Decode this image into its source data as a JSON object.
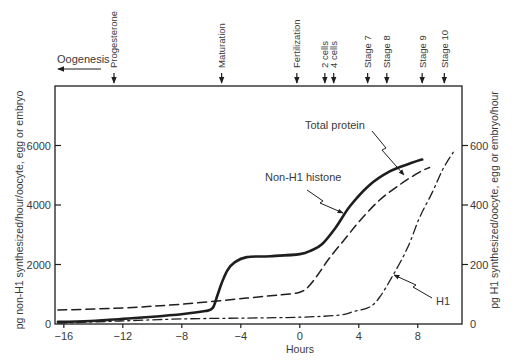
{
  "chart_data": {
    "type": "line",
    "title": "",
    "xlabel": "Hours",
    "ylabel": "pg non-H1 synthesized/hour/oocyte, egg or embryo",
    "ylabel_right": "pg H1 synthesized/oocyte, egg or embryo/hour",
    "xlim": [
      -16.6,
      11.0
    ],
    "ylim": [
      0,
      8000
    ],
    "ylim_right": [
      0,
      800
    ],
    "xticks": [
      -16,
      -12,
      -8,
      -4,
      0,
      4,
      8
    ],
    "xtick_labels": [
      "−16",
      "−12",
      "−8",
      "−4",
      "0",
      "4",
      "8"
    ],
    "yticks": [
      0,
      2000,
      4000,
      6000
    ],
    "ytick_labels": [
      "0",
      "2000",
      "4000",
      "6000"
    ],
    "yticks_right": [
      0,
      200,
      400,
      600
    ],
    "ytick_labels_right": [
      "0",
      "200",
      "400",
      "600"
    ],
    "grid": false,
    "legend": "none - curves labeled directly with pointer arrows",
    "series": [
      {
        "name": "Non-H1 histone",
        "axis": "left",
        "style": "solid",
        "x": [
          -16.4,
          -14.2,
          -12.0,
          -10.2,
          -7.9,
          -6.4,
          -5.9,
          -5.6,
          -5.3,
          -4.9,
          -4.4,
          -3.6,
          -2.0,
          0.0,
          0.8,
          1.5,
          2.4,
          3.4,
          4.7,
          6.1,
          7.5,
          8.3
        ],
        "y": [
          70,
          100,
          170,
          235,
          335,
          435,
          540,
          940,
          1370,
          1810,
          2080,
          2250,
          2280,
          2350,
          2480,
          2680,
          3220,
          3960,
          4660,
          5130,
          5400,
          5530
        ]
      },
      {
        "name": "Total protein",
        "axis": "left",
        "style": "dashed",
        "x": [
          -16.4,
          -12.0,
          -7.9,
          -3.6,
          -0.7,
          0.0,
          0.5,
          1.2,
          2.0,
          3.1,
          4.1,
          5.4,
          6.8,
          8.1,
          8.8
        ],
        "y": [
          470,
          540,
          670,
          870,
          1010,
          1070,
          1210,
          1640,
          2210,
          2880,
          3490,
          4160,
          4690,
          5100,
          5260
        ]
      },
      {
        "name": "H1",
        "axis": "right",
        "style": "dash-dot",
        "x": [
          -16.4,
          -12.2,
          -7.9,
          -3.6,
          0.0,
          2.7,
          3.7,
          4.7,
          5.4,
          6.3,
          7.3,
          8.1,
          9.0,
          9.7,
          10.4
        ],
        "y": [
          3,
          10,
          17,
          20,
          23,
          30,
          43,
          56,
          89,
          162,
          255,
          355,
          444,
          520,
          577
        ]
      }
    ],
    "events": [
      {
        "label": "Progesterone",
        "hour": -12.6
      },
      {
        "label": "Maturation",
        "hour": -5.3
      },
      {
        "label": "Fertilization",
        "hour": -0.2
      },
      {
        "label": "2 cells",
        "hour": 1.7
      },
      {
        "label": "4 cells",
        "hour": 2.3
      },
      {
        "label": "Stage 7",
        "hour": 4.6
      },
      {
        "label": "Stage 8",
        "hour": 5.9
      },
      {
        "label": "Stage 9",
        "hour": 8.3
      },
      {
        "label": "Stage 10",
        "hour": 9.8
      }
    ],
    "oogenesis": {
      "label": "Oogenesis",
      "direction": "left"
    },
    "curve_labels": [
      {
        "text": "Total protein",
        "points_to": "Total protein"
      },
      {
        "text": "Non-H1 histone",
        "points_to": "Non-H1 histone"
      },
      {
        "text": "H1",
        "points_to": "H1"
      }
    ],
    "colors": {
      "line": "#1e1e1e",
      "text": "#3a3a3a",
      "background": "#ffffff"
    }
  }
}
